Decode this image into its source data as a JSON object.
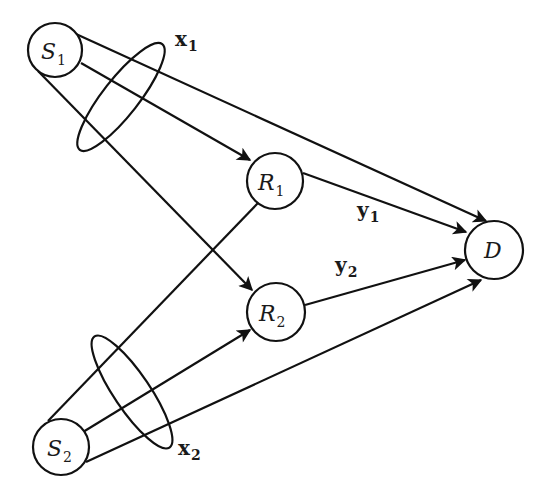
{
  "diagram": {
    "type": "relay-network",
    "stroke_color": "#111111",
    "background": "#ffffff",
    "nodes": [
      {
        "id": "S1",
        "main": "S",
        "sub": "1",
        "cx": 55,
        "cy": 50,
        "r": 27
      },
      {
        "id": "R1",
        "main": "R",
        "sub": "1",
        "cx": 275,
        "cy": 181,
        "r": 28
      },
      {
        "id": "R2",
        "main": "R",
        "sub": "2",
        "cx": 276,
        "cy": 312,
        "r": 29
      },
      {
        "id": "D",
        "main": "D",
        "sub": "",
        "cx": 494,
        "cy": 250,
        "r": 29
      },
      {
        "id": "S2",
        "main": "S",
        "sub": "2",
        "cx": 61,
        "cy": 447,
        "r": 28
      }
    ],
    "edges": [
      {
        "from": "S1",
        "to": "D",
        "arrow": true
      },
      {
        "from": "S1",
        "to": "R1",
        "arrow": true
      },
      {
        "from": "S1",
        "to": "R2",
        "arrow": true
      },
      {
        "from": "R1",
        "to": "D",
        "arrow": true,
        "label": "y1"
      },
      {
        "from": "R2",
        "to": "D",
        "arrow": true,
        "label": "y2"
      },
      {
        "from": "S2",
        "to": "R1",
        "arrow": false
      },
      {
        "from": "S2",
        "to": "R2",
        "arrow": true
      },
      {
        "from": "S2",
        "to": "D",
        "arrow": true
      }
    ],
    "groupings": [
      {
        "label_main": "x",
        "label_sub": "1",
        "around": "S1 outgoing edges"
      },
      {
        "label_main": "x",
        "label_sub": "2",
        "around": "S2 outgoing edges"
      }
    ],
    "edge_labels": [
      {
        "main": "y",
        "sub": "1"
      },
      {
        "main": "y",
        "sub": "2"
      }
    ]
  }
}
